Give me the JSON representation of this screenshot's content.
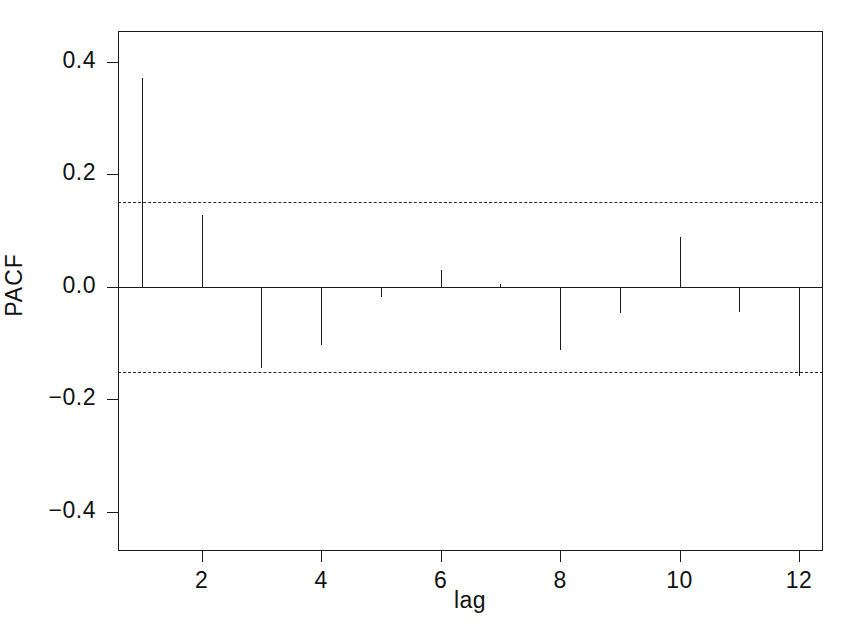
{
  "chart_data": {
    "type": "bar",
    "subtype": "stem-correlogram",
    "title": "",
    "xlabel": "lag",
    "ylabel": "PACF",
    "x": [
      1,
      2,
      3,
      4,
      5,
      6,
      7,
      8,
      9,
      10,
      11,
      12
    ],
    "categories": [
      "1",
      "2",
      "3",
      "4",
      "5",
      "6",
      "7",
      "8",
      "9",
      "10",
      "11",
      "12"
    ],
    "values": [
      0.372,
      0.128,
      -0.144,
      -0.104,
      -0.018,
      0.03,
      0.005,
      -0.113,
      -0.047,
      0.088,
      -0.045,
      -0.159
    ],
    "series": [
      {
        "name": "PACF",
        "values": [
          0.372,
          0.128,
          -0.144,
          -0.104,
          -0.018,
          0.03,
          0.005,
          -0.113,
          -0.047,
          0.088,
          -0.045,
          -0.159
        ]
      }
    ],
    "xlim": [
      0.6,
      12.4
    ],
    "ylim": [
      -0.47,
      0.455
    ],
    "xticks": [
      2,
      4,
      6,
      8,
      10,
      12
    ],
    "xticklabels": [
      "2",
      "4",
      "6",
      "8",
      "10",
      "12"
    ],
    "yticks": [
      0.4,
      0.2,
      0.0,
      -0.2,
      -0.4
    ],
    "yticklabels": [
      "0.4",
      "0.2",
      "0.0",
      "-0.2",
      "-0.4"
    ],
    "grid": false,
    "legend": false,
    "legend_position": "none",
    "baseline": 0.0,
    "confidence_bands": {
      "upper": 0.151,
      "lower": -0.151,
      "style": "dashed",
      "label": ""
    },
    "colors": {
      "stem": "#1b1b1b",
      "axis": "#1b1b1b",
      "confidence": "#2a2a2a",
      "background": "#ffffff"
    }
  }
}
